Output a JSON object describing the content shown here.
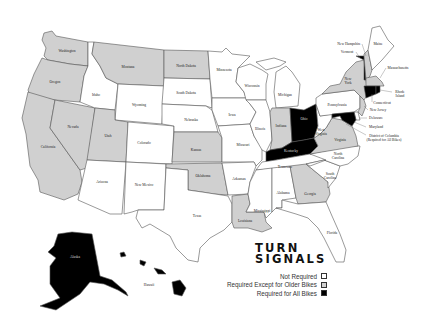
{
  "title": {
    "line1": "TURN",
    "line2": "SIGNALS"
  },
  "legend": [
    {
      "label": "Not Required",
      "color": "#ffffff",
      "key": "none"
    },
    {
      "label": "Required Except for Older Bikes",
      "color": "#d0d0d0",
      "key": "older"
    },
    {
      "label": "Required for All Bikes",
      "color": "#000000",
      "key": "all"
    }
  ],
  "colors": {
    "none": "#ffffff",
    "older": "#d0d0d0",
    "all": "#000000",
    "border": "#555555"
  },
  "states": [
    {
      "id": "WA",
      "name": "Washington",
      "status": "older"
    },
    {
      "id": "OR",
      "name": "Oregon",
      "status": "older"
    },
    {
      "id": "CA",
      "name": "California",
      "status": "older"
    },
    {
      "id": "NV",
      "name": "Nevada",
      "status": "older"
    },
    {
      "id": "ID",
      "name": "Idaho",
      "status": "none"
    },
    {
      "id": "MT",
      "name": "Montana",
      "status": "older"
    },
    {
      "id": "WY",
      "name": "Wyoming",
      "status": "none"
    },
    {
      "id": "UT",
      "name": "Utah",
      "status": "older"
    },
    {
      "id": "CO",
      "name": "Colorado",
      "status": "none"
    },
    {
      "id": "AZ",
      "name": "Arizona",
      "status": "none"
    },
    {
      "id": "NM",
      "name": "New Mexico",
      "status": "none"
    },
    {
      "id": "ND",
      "name": "North Dakota",
      "status": "older"
    },
    {
      "id": "SD",
      "name": "South Dakota",
      "status": "none"
    },
    {
      "id": "NE",
      "name": "Nebraska",
      "status": "none"
    },
    {
      "id": "KS",
      "name": "Kansas",
      "status": "older"
    },
    {
      "id": "OK",
      "name": "Oklahoma",
      "status": "older"
    },
    {
      "id": "TX",
      "name": "Texas",
      "status": "none"
    },
    {
      "id": "MN",
      "name": "Minnesota",
      "status": "none"
    },
    {
      "id": "IA",
      "name": "Iowa",
      "status": "none"
    },
    {
      "id": "MO",
      "name": "Missouri",
      "status": "none"
    },
    {
      "id": "AR",
      "name": "Arkansas",
      "status": "none"
    },
    {
      "id": "LA",
      "name": "Louisiana",
      "status": "older"
    },
    {
      "id": "WI",
      "name": "Wisconsin",
      "status": "none"
    },
    {
      "id": "IL",
      "name": "Illinois",
      "status": "none"
    },
    {
      "id": "MI",
      "name": "Michigan",
      "status": "none"
    },
    {
      "id": "IN",
      "name": "Indiana",
      "status": "older"
    },
    {
      "id": "OH",
      "name": "Ohio",
      "status": "all"
    },
    {
      "id": "KY",
      "name": "Kentucky",
      "status": "all"
    },
    {
      "id": "TN",
      "name": "Tennessee",
      "status": "none"
    },
    {
      "id": "MS",
      "name": "Mississippi",
      "status": "none"
    },
    {
      "id": "AL",
      "name": "Alabama",
      "status": "none"
    },
    {
      "id": "GA",
      "name": "Georgia",
      "status": "older"
    },
    {
      "id": "FL",
      "name": "Florida",
      "status": "none"
    },
    {
      "id": "SC",
      "name": "South Carolina",
      "status": "none"
    },
    {
      "id": "NC",
      "name": "North Carolina",
      "status": "none"
    },
    {
      "id": "VA",
      "name": "Virginia",
      "status": "older"
    },
    {
      "id": "WV",
      "name": "West Virginia",
      "status": "none"
    },
    {
      "id": "PA",
      "name": "Pennsylvania",
      "status": "none"
    },
    {
      "id": "NY",
      "name": "New York",
      "status": "older"
    },
    {
      "id": "VT",
      "name": "Vermont",
      "status": "all"
    },
    {
      "id": "NH",
      "name": "New Hampshire",
      "status": "older"
    },
    {
      "id": "ME",
      "name": "Maine",
      "status": "none"
    },
    {
      "id": "MA",
      "name": "Massachusetts",
      "status": "older"
    },
    {
      "id": "RI",
      "name": "Rhode Island",
      "status": "all"
    },
    {
      "id": "CT",
      "name": "Connecticut",
      "status": "all"
    },
    {
      "id": "NJ",
      "name": "New Jersey",
      "status": "older"
    },
    {
      "id": "DE",
      "name": "Delaware",
      "status": "none"
    },
    {
      "id": "MD",
      "name": "Maryland",
      "status": "all"
    },
    {
      "id": "DC",
      "name": "District of Columbia",
      "status": "all"
    },
    {
      "id": "AK",
      "name": "Alaska",
      "status": "all"
    },
    {
      "id": "HI",
      "name": "Hawaii",
      "status": "all"
    }
  ],
  "labels": {
    "WA": "Washington",
    "OR": "Oregon",
    "CA": "California",
    "NV": "Nevada",
    "ID": "Idaho",
    "MT": "Montana",
    "WY": "Wyoming",
    "UT": "Utah",
    "CO": "Colorado",
    "AZ": "Arizona",
    "NM": "New Mexico",
    "ND": "North Dakota",
    "SD": "South Dakota",
    "NE": "Nebraska",
    "KS": "Kansas",
    "OK": "Oklahoma",
    "TX": "Texas",
    "MN": "Minnesota",
    "IA": "Iowa",
    "MO": "Missouri",
    "AR": "Arkansas",
    "LA": "Louisiana",
    "WI": "Wisconsin",
    "IL": "Illinois",
    "MI": "Michigan",
    "IN": "Indiana",
    "OH": "Ohio",
    "KY": "Kentucky",
    "TN": "Tennessee",
    "MS": "Mississippi",
    "AL": "Alabama",
    "GA": "Georgia",
    "FL": "Florida",
    "SC1": "South",
    "SC2": "Carolina",
    "NC1": "North",
    "NC2": "Carolina",
    "VA": "Virginia",
    "WV1": "West",
    "WV2": "Virginia",
    "PA": "Pennsylvania",
    "NY1": "New",
    "NY2": "York",
    "VT": "Vermont",
    "NH": "New Hampshire",
    "ME": "Maine",
    "MA": "Massachusetts",
    "RI1": "Rhode",
    "RI2": "Island",
    "CT": "Connecticut",
    "NJ": "New Jersey",
    "DE": "Delaware",
    "MD": "Maryland",
    "DC1": "District of Columbia",
    "DC2": "(Required for All Bikes)",
    "AK": "Alaska",
    "HI": "Hawaii"
  }
}
